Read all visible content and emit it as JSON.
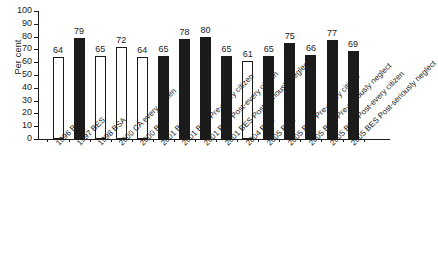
{
  "chart_data": {
    "type": "bar",
    "title": "",
    "xlabel": "",
    "ylabel": "Per cent",
    "ylim": [
      0,
      100
    ],
    "ytick_step": 10,
    "yticks": [
      0,
      10,
      20,
      30,
      40,
      50,
      60,
      70,
      80,
      90,
      100
    ],
    "grid": false,
    "legend": "none",
    "categories": [
      "1996 BSA",
      "1997 BES",
      "1998 BSA",
      "2000 CA every citizen",
      "2000 BSA",
      "2001 BSA",
      "2001 BES Pre-every citizen",
      "2001 BES Post-every citizen",
      "2001 BES Post-seriously neglect",
      "2004 BSA",
      "2005 BSA",
      "2005 BES Pre-every citizen",
      "2005 BES Pre-seriously neglect",
      "2005 BES Post-every citizen",
      "2005 BES Post-seriously neglect"
    ],
    "values": [
      64,
      79,
      65,
      72,
      64,
      65,
      78,
      80,
      65,
      61,
      65,
      75,
      66,
      77,
      69
    ],
    "bar_fills": [
      "white",
      "black",
      "white",
      "white",
      "white",
      "black",
      "black",
      "black",
      "black",
      "white",
      "black",
      "black",
      "black",
      "black",
      "black"
    ],
    "colors": {
      "bar_outline": "#1b1b1b",
      "bar_fill_black": "#1b1b1b",
      "bar_fill_white": "#ffffff",
      "axis": "#1b1b1b",
      "background": "#ffffff"
    }
  }
}
